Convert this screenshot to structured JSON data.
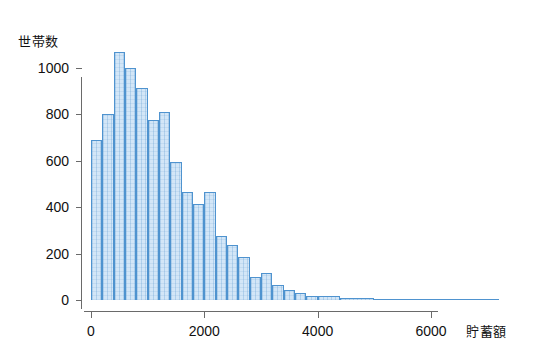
{
  "chart_data": {
    "type": "bar",
    "subtype": "histogram",
    "title": "",
    "xlabel": "貯蓄額",
    "ylabel": "世帯数",
    "xlim": [
      0,
      7200
    ],
    "ylim": [
      0,
      1100
    ],
    "bin_width": 200,
    "grid": false,
    "legend": null,
    "x_ticks": [
      0,
      2000,
      4000,
      6000
    ],
    "x_tick_labels": [
      "0",
      "2000",
      "4000",
      "6000"
    ],
    "y_ticks": [
      0,
      200,
      400,
      600,
      800,
      1000
    ],
    "y_tick_labels": [
      "0",
      "200",
      "400",
      "600",
      "800",
      "1000"
    ],
    "bin_starts": [
      0,
      200,
      400,
      600,
      800,
      1000,
      1200,
      1400,
      1600,
      1800,
      2000,
      2200,
      2400,
      2600,
      2800,
      3000,
      3200,
      3400,
      3600,
      3800,
      4000,
      4400,
      5000
    ],
    "categories": [
      "0-200",
      "200-400",
      "400-600",
      "600-800",
      "800-1000",
      "1000-1200",
      "1200-1400",
      "1400-1600",
      "1600-1800",
      "1800-2000",
      "2000-2200",
      "2200-2400",
      "2400-2600",
      "2600-2800",
      "2800-3000",
      "3000-3200",
      "3200-3400",
      "3400-3600",
      "3600-3800",
      "3800-4000",
      "4000-4400",
      "4400-5000",
      "5000-7200"
    ],
    "values": [
      690,
      800,
      1070,
      1000,
      915,
      775,
      810,
      595,
      465,
      415,
      465,
      275,
      235,
      185,
      100,
      115,
      65,
      42,
      30,
      18,
      18,
      10,
      5
    ],
    "colors": {
      "bar_fill": "#d3e6f7",
      "bar_edge": "#4f93cf",
      "axis": "#6a6a6a",
      "text": "#111111",
      "background": "#ffffff"
    }
  },
  "axes": {
    "y_title": "世帯数",
    "x_title": "貯蓄額"
  }
}
